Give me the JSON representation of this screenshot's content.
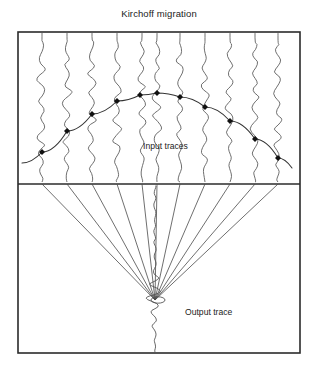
{
  "figure": {
    "title": "Kirchoff migration",
    "labels": {
      "input_traces": "Input traces",
      "output_trace": "Output trace"
    },
    "frame": {
      "x": 18,
      "y": 32,
      "width": 282,
      "height": 321,
      "divider_y": 184
    },
    "colors": {
      "frame": "#2b2b2b",
      "trace": "#555555",
      "curve": "#333333",
      "ray": "#4a4a4a",
      "dot": "#111111",
      "background": "#ffffff"
    },
    "upper_panel": {
      "description": "Input seismic wiggle traces crossed by a hyperbolic diffraction curve",
      "trace_count": 11,
      "trace_x": [
        42,
        67,
        92,
        117,
        142,
        157,
        180,
        205,
        230,
        255,
        278
      ],
      "trace_top_y": 32,
      "trace_bottom_y": 182,
      "hyperbola": {
        "apex_x": 155,
        "apex_y": 93,
        "left_end": {
          "x": 22,
          "y": 163
        },
        "right_end": {
          "x": 292,
          "y": 168
        },
        "marker_points": [
          {
            "x": 42,
            "y": 152
          },
          {
            "x": 67,
            "y": 131
          },
          {
            "x": 92,
            "y": 114
          },
          {
            "x": 117,
            "y": 101
          },
          {
            "x": 140,
            "y": 95
          },
          {
            "x": 157,
            "y": 93
          },
          {
            "x": 180,
            "y": 97
          },
          {
            "x": 205,
            "y": 107
          },
          {
            "x": 230,
            "y": 121
          },
          {
            "x": 255,
            "y": 139
          },
          {
            "x": 278,
            "y": 158
          }
        ]
      }
    },
    "lower_panel": {
      "description": "Migration rays fan from each input trace position and converge on the output trace focal point",
      "ray_count": 11,
      "ray_origin_x": [
        42,
        67,
        92,
        117,
        142,
        157,
        180,
        205,
        230,
        255,
        278
      ],
      "ray_origin_y": 184,
      "focus": {
        "x": 155,
        "y": 300
      },
      "output_trace": {
        "x": 155,
        "top_y": 186,
        "bottom_y": 352
      }
    }
  },
  "chart_data": {
    "type": "line",
    "title": "Kirchoff migration",
    "xlabel": "",
    "ylabel": "",
    "annotations": [
      "Input traces",
      "Output trace"
    ],
    "series": [
      {
        "name": "Diffraction hyperbola (input traces panel)",
        "x": [
          22,
          42,
          67,
          92,
          117,
          140,
          157,
          180,
          205,
          230,
          255,
          278,
          292
        ],
        "values": [
          163,
          152,
          131,
          114,
          101,
          95,
          93,
          97,
          107,
          121,
          139,
          158,
          168
        ]
      }
    ]
  }
}
